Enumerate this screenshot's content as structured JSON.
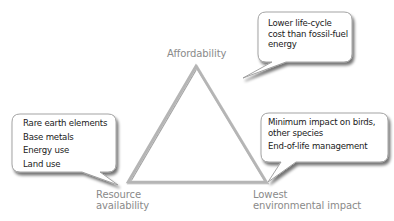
{
  "diagram": {
    "type": "triangle-tradeoff",
    "colors": {
      "triangle_stroke": "#b5b5b5",
      "bubble_fill": "#ffffff",
      "bubble_stroke": "#9a9a9a",
      "bubble_shadow": "#8c8c8c",
      "vertex_label": "#8a8a8a",
      "bubble_text": "#1a1a1a"
    },
    "vertices": {
      "top": {
        "label": "Affordability"
      },
      "bottom_left": {
        "label_line1": "Resource",
        "label_line2": "availability"
      },
      "bottom_right": {
        "label_line1": "Lowest",
        "label_line2": "environmental impact"
      }
    },
    "callouts": {
      "affordability": {
        "lines": [
          "Lower life-cycle",
          "cost than fossil-fuel",
          "energy"
        ]
      },
      "resource": {
        "items": [
          "Rare earth elements",
          "Base metals",
          "Energy use",
          "Land use"
        ]
      },
      "environment": {
        "item1_line1": "Minimum impact on birds,",
        "item1_line2": "other species",
        "item2": "End-of-life management"
      }
    }
  }
}
